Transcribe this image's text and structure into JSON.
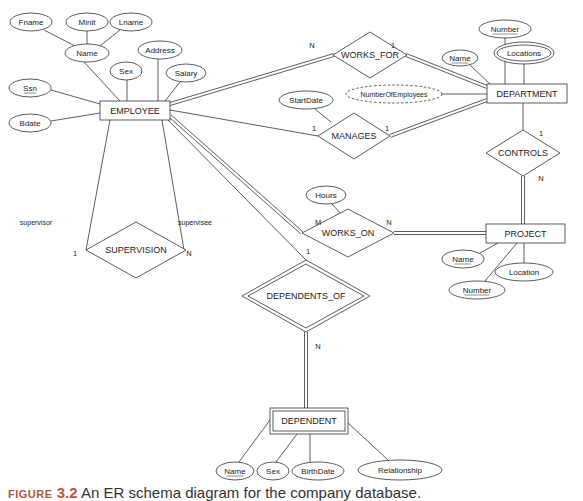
{
  "caption": {
    "figure_label": "FIGURE",
    "figure_number": "3.2",
    "text": "An ER schema diagram for the company database."
  },
  "colors": {
    "line": "#333333",
    "text": "#222222",
    "background": "#ffffff",
    "caption_accent": "#b05a3a"
  },
  "entities": [
    {
      "id": "employee",
      "label": "EMPLOYEE",
      "weak": false,
      "x": 100,
      "y": 101,
      "w": 70,
      "h": 19
    },
    {
      "id": "department",
      "label": "DEPARTMENT",
      "weak": false,
      "x": 487,
      "y": 84,
      "w": 80,
      "h": 19
    },
    {
      "id": "project",
      "label": "PROJECT",
      "weak": false,
      "x": 486,
      "y": 224,
      "w": 79,
      "h": 19
    },
    {
      "id": "dependent",
      "label": "DEPENDENT",
      "weak": true,
      "x": 270,
      "y": 408,
      "w": 78,
      "h": 26
    }
  ],
  "relationships": [
    {
      "id": "works_for",
      "label": "WORKS_FOR",
      "identifying": false,
      "cx": 370,
      "cy": 55,
      "hw": 37,
      "hh": 23
    },
    {
      "id": "manages",
      "label": "MANAGES",
      "identifying": false,
      "cx": 354,
      "cy": 136,
      "hw": 36,
      "hh": 23
    },
    {
      "id": "controls",
      "label": "CONTROLS",
      "identifying": false,
      "cx": 523,
      "cy": 153,
      "hw": 37,
      "hh": 23
    },
    {
      "id": "works_on",
      "label": "WORKS_ON",
      "identifying": false,
      "cx": 348,
      "cy": 233,
      "hw": 46,
      "hh": 24
    },
    {
      "id": "supervision",
      "label": "SUPERVISION",
      "identifying": false,
      "cx": 136,
      "cy": 250,
      "hw": 50,
      "hh": 28
    },
    {
      "id": "dependents_of",
      "label": "DEPENDENTS_OF",
      "identifying": true,
      "cx": 306,
      "cy": 296,
      "hw": 64,
      "hh": 36
    }
  ],
  "attributes": [
    {
      "id": "fname",
      "label": "Fname",
      "cx": 31,
      "cy": 22,
      "rx": 21,
      "ry": 9,
      "key": false,
      "multivalued": false,
      "derived": false
    },
    {
      "id": "minit",
      "label": "Minit",
      "cx": 87,
      "cy": 22,
      "rx": 21,
      "ry": 9,
      "key": false,
      "multivalued": false,
      "derived": false
    },
    {
      "id": "lname",
      "label": "Lname",
      "cx": 131,
      "cy": 22,
      "rx": 21,
      "ry": 9,
      "key": false,
      "multivalued": false,
      "derived": false
    },
    {
      "id": "name_emp",
      "label": "Name",
      "cx": 87,
      "cy": 53,
      "rx": 22,
      "ry": 9,
      "key": false,
      "multivalued": false,
      "derived": false
    },
    {
      "id": "address",
      "label": "Address",
      "cx": 160,
      "cy": 50,
      "rx": 22,
      "ry": 9,
      "key": false,
      "multivalued": false,
      "derived": false
    },
    {
      "id": "sex_emp",
      "label": "Sex",
      "cx": 126,
      "cy": 71,
      "rx": 16,
      "ry": 9,
      "key": false,
      "multivalued": false,
      "derived": false
    },
    {
      "id": "salary",
      "label": "Salary",
      "cx": 186,
      "cy": 73,
      "rx": 20,
      "ry": 9,
      "key": false,
      "multivalued": false,
      "derived": false
    },
    {
      "id": "ssn",
      "label": "Ssn",
      "cx": 30,
      "cy": 88,
      "rx": 21,
      "ry": 9,
      "key": true,
      "multivalued": false,
      "derived": false
    },
    {
      "id": "bdate",
      "label": "Bdate",
      "cx": 30,
      "cy": 123,
      "rx": 21,
      "ry": 9,
      "key": false,
      "multivalued": false,
      "derived": false
    },
    {
      "id": "dept_number",
      "label": "Number",
      "cx": 505,
      "cy": 29,
      "rx": 26,
      "ry": 9,
      "key": true,
      "multivalued": false,
      "derived": false
    },
    {
      "id": "dept_name",
      "label": "Name",
      "cx": 460,
      "cy": 58,
      "rx": 18,
      "ry": 8,
      "key": true,
      "multivalued": false,
      "derived": false
    },
    {
      "id": "locations",
      "label": "Locations",
      "cx": 524,
      "cy": 53,
      "rx": 30,
      "ry": 11,
      "key": false,
      "multivalued": true,
      "derived": false
    },
    {
      "id": "num_employees",
      "label": "NumberOfEmployees",
      "cx": 394,
      "cy": 94,
      "rx": 48,
      "ry": 9,
      "key": false,
      "multivalued": false,
      "derived": true
    },
    {
      "id": "startdate",
      "label": "StartDate",
      "cx": 306,
      "cy": 100,
      "rx": 27,
      "ry": 9,
      "key": false,
      "multivalued": false,
      "derived": false
    },
    {
      "id": "hours",
      "label": "Hours",
      "cx": 326,
      "cy": 195,
      "rx": 20,
      "ry": 9,
      "key": false,
      "multivalued": false,
      "derived": false
    },
    {
      "id": "proj_name",
      "label": "Name",
      "cx": 463,
      "cy": 259,
      "rx": 21,
      "ry": 9,
      "key": true,
      "multivalued": false,
      "derived": false
    },
    {
      "id": "proj_number",
      "label": "Number",
      "cx": 477,
      "cy": 290,
      "rx": 28,
      "ry": 9,
      "key": true,
      "multivalued": false,
      "derived": false
    },
    {
      "id": "location",
      "label": "Location",
      "cx": 524,
      "cy": 272,
      "rx": 29,
      "ry": 9,
      "key": false,
      "multivalued": false,
      "derived": false
    },
    {
      "id": "dep_name",
      "label": "Name",
      "cx": 235,
      "cy": 471,
      "rx": 19,
      "ry": 9,
      "key": true,
      "multivalued": false,
      "derived": false
    },
    {
      "id": "dep_sex",
      "label": "Sex",
      "cx": 273,
      "cy": 471,
      "rx": 16,
      "ry": 9,
      "key": false,
      "multivalued": false,
      "derived": false
    },
    {
      "id": "birthdate",
      "label": "BirthDate",
      "cx": 318,
      "cy": 471,
      "rx": 26,
      "ry": 9,
      "key": false,
      "multivalued": false,
      "derived": false
    },
    {
      "id": "relationship",
      "label": "Relationship",
      "cx": 400,
      "cy": 470,
      "rx": 42,
      "ry": 10,
      "key": false,
      "multivalued": false,
      "derived": false
    }
  ],
  "lines": [
    {
      "from": "fname",
      "x1": 44,
      "y1": 30,
      "x2": 75,
      "y2": 46,
      "double": false
    },
    {
      "from": "minit",
      "x1": 87,
      "y1": 31,
      "x2": 87,
      "y2": 44,
      "double": false
    },
    {
      "from": "lname",
      "x1": 120,
      "y1": 30,
      "x2": 100,
      "y2": 46,
      "double": false
    },
    {
      "from": "name_emp",
      "x1": 84,
      "y1": 62,
      "x2": 120,
      "y2": 101,
      "double": false
    },
    {
      "from": "sex_emp",
      "x1": 127,
      "y1": 80,
      "x2": 127,
      "y2": 101,
      "double": false
    },
    {
      "from": "address",
      "x1": 158,
      "y1": 59,
      "x2": 158,
      "y2": 101,
      "double": false
    },
    {
      "from": "salary",
      "x1": 180,
      "y1": 82,
      "x2": 165,
      "y2": 101,
      "double": false
    },
    {
      "from": "ssn",
      "x1": 51,
      "y1": 90,
      "x2": 100,
      "y2": 104,
      "double": false
    },
    {
      "from": "bdate",
      "x1": 51,
      "y1": 121,
      "x2": 100,
      "y2": 113,
      "double": false
    },
    {
      "from": "emp-worksfor",
      "x1": 170,
      "y1": 104,
      "x2": 334,
      "y2": 55,
      "double": true
    },
    {
      "from": "worksfor-dept",
      "x1": 406,
      "y1": 55,
      "x2": 487,
      "y2": 87,
      "double": true
    },
    {
      "from": "dept_number",
      "x1": 505,
      "y1": 38,
      "x2": 505,
      "y2": 84,
      "double": false
    },
    {
      "from": "dept_name",
      "x1": 470,
      "y1": 65,
      "x2": 490,
      "y2": 84,
      "double": false
    },
    {
      "from": "locations",
      "x1": 524,
      "y1": 64,
      "x2": 524,
      "y2": 84,
      "double": false
    },
    {
      "from": "num_employees",
      "x1": 442,
      "y1": 94,
      "x2": 487,
      "y2": 94,
      "double": false
    },
    {
      "from": "emp-manages",
      "x1": 170,
      "y1": 110,
      "x2": 318,
      "y2": 136,
      "double": false
    },
    {
      "from": "startdate",
      "x1": 315,
      "y1": 109,
      "x2": 331,
      "y2": 122,
      "double": false
    },
    {
      "from": "manages-dept",
      "x1": 390,
      "y1": 136,
      "x2": 487,
      "y2": 100,
      "double": true
    },
    {
      "from": "dept-controls",
      "x1": 523,
      "y1": 103,
      "x2": 523,
      "y2": 130,
      "double": false
    },
    {
      "from": "controls-proj",
      "x1": 523,
      "y1": 176,
      "x2": 523,
      "y2": 224,
      "double": true
    },
    {
      "from": "emp-workson",
      "x1": 170,
      "y1": 116,
      "x2": 302,
      "y2": 233,
      "double": true
    },
    {
      "from": "hours",
      "x1": 332,
      "y1": 204,
      "x2": 341,
      "y2": 214,
      "double": false
    },
    {
      "from": "workson-proj",
      "x1": 394,
      "y1": 233,
      "x2": 486,
      "y2": 233,
      "double": true
    },
    {
      "from": "proj_name",
      "x1": 480,
      "y1": 253,
      "x2": 498,
      "y2": 243,
      "double": false
    },
    {
      "from": "proj_number",
      "x1": 485,
      "y1": 281,
      "x2": 517,
      "y2": 243,
      "double": false
    },
    {
      "from": "location",
      "x1": 524,
      "y1": 263,
      "x2": 524,
      "y2": 243,
      "double": false
    },
    {
      "from": "emp-dependentsof",
      "x1": 168,
      "y1": 120,
      "x2": 306,
      "y2": 260,
      "double": false
    },
    {
      "from": "dependentsof-dependent",
      "x1": 306,
      "y1": 332,
      "x2": 306,
      "y2": 408,
      "double": true
    },
    {
      "from": "emp-supervisor",
      "x1": 110,
      "y1": 120,
      "x2": 86,
      "y2": 250,
      "double": false
    },
    {
      "from": "emp-supervisee",
      "x1": 162,
      "y1": 120,
      "x2": 184,
      "y2": 250,
      "double": false
    },
    {
      "from": "dep_name",
      "x1": 239,
      "y1": 462,
      "x2": 270,
      "y2": 420,
      "double": false
    },
    {
      "from": "dep_sex",
      "x1": 276,
      "y1": 462,
      "x2": 297,
      "y2": 434,
      "double": false
    },
    {
      "from": "birthdate",
      "x1": 310,
      "y1": 462,
      "x2": 310,
      "y2": 434,
      "double": false
    },
    {
      "from": "relationship",
      "x1": 388,
      "y1": 460,
      "x2": 348,
      "y2": 423,
      "double": false
    }
  ],
  "cardinalities": [
    {
      "text": "N",
      "x": 312,
      "y": 45
    },
    {
      "text": "1",
      "x": 393,
      "y": 45
    },
    {
      "text": "1",
      "x": 314,
      "y": 128
    },
    {
      "text": "1",
      "x": 387,
      "y": 128
    },
    {
      "text": "1",
      "x": 541,
      "y": 133
    },
    {
      "text": "N",
      "x": 541,
      "y": 178
    },
    {
      "text": "M",
      "x": 318,
      "y": 222
    },
    {
      "text": "N",
      "x": 389,
      "y": 222
    },
    {
      "text": "1",
      "x": 308,
      "y": 251
    },
    {
      "text": "N",
      "x": 318,
      "y": 346
    },
    {
      "text": "1",
      "x": 75,
      "y": 253
    },
    {
      "text": "N",
      "x": 189,
      "y": 253
    }
  ],
  "roles": [
    {
      "text": "supervisor",
      "x": 36,
      "y": 222
    },
    {
      "text": "supervisee",
      "x": 195,
      "y": 222
    }
  ]
}
